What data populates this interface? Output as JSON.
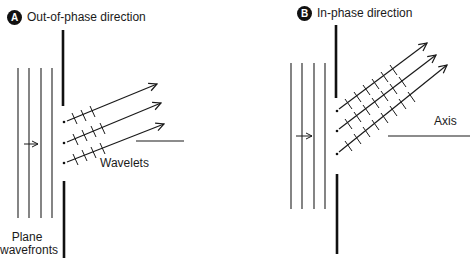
{
  "panels": [
    {
      "badge": "A",
      "title": "Out-of-phase direction",
      "labels": {
        "wavelets": "Wavelets",
        "wavefronts_line1": "Plane",
        "wavefronts_line2": "wavefronts"
      }
    },
    {
      "badge": "B",
      "title": "In-phase direction",
      "labels": {
        "axis": "Axis"
      }
    }
  ],
  "colors": {
    "ink": "#1a1a1a",
    "background": "#ffffff"
  }
}
